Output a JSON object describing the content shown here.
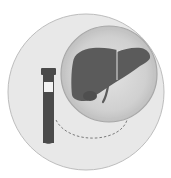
{
  "illustration": {
    "subject": "liver-blood-test",
    "elements": [
      "outer-circle",
      "blood-test-tube",
      "magnifier-circle",
      "liver",
      "dashed-connector"
    ],
    "colors": {
      "background": "#ffffff",
      "outer_circle_fill": "#e8e8e8",
      "outer_circle_stroke": "#bdbdbd",
      "inner_circle_fill": "#d2d2d2",
      "inner_circle_stroke": "#a8a8a8",
      "liver": "#5b5b5b",
      "tube": "#4a4a4a",
      "tube_label": "#f2f2f2",
      "connector": "#6e6e6e"
    }
  }
}
